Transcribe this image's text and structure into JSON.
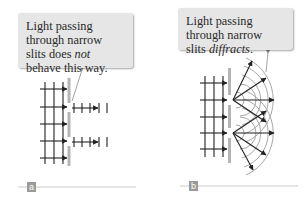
{
  "panels": [
    {
      "id": "a",
      "label": "a",
      "callout": {
        "text_before": "Light passing through narrow slits does ",
        "text_emphasis": "not",
        "text_after": " behave this way."
      }
    },
    {
      "id": "b",
      "label": "b",
      "callout": {
        "text_before": "Light passing through narrow slits ",
        "text_emphasis": "diffracts",
        "text_after": "."
      }
    }
  ],
  "colors": {
    "callout_bg": "#e6e6e6",
    "wall": "#b5b5b5",
    "ray": "#222222",
    "wavefront_arc": "#a8a8a8",
    "label_box": "#9a9a9a",
    "rule_line": "#cccccc"
  }
}
